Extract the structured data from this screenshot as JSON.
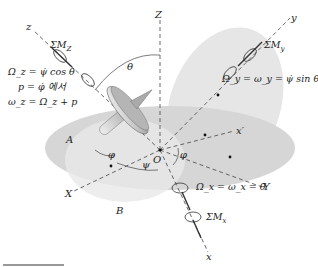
{
  "diagram": {
    "axes": {
      "fixed": [
        "X",
        "Y",
        "Z"
      ],
      "moving": [
        "x",
        "y",
        "z"
      ],
      "auxiliary": "x'",
      "origin": "O"
    },
    "angles": [
      "θ",
      "φ",
      "ψ",
      "φ"
    ],
    "points": [
      "A",
      "B"
    ],
    "moments": {
      "z": "ΣM_z",
      "y": "ΣM_y",
      "x": "ΣM_x"
    },
    "equations": {
      "z_line1": "Ω_z = ψ̇ cos θ",
      "z_line2": "p = φ̇ 에서",
      "z_line3": "ω_z = Ω_z + p",
      "y": "Ω_y = ω_y = ψ̇ sin θ",
      "x": "Ω_x = ω_x = θ̇"
    }
  },
  "labels": {
    "z": "z",
    "Z": "Z",
    "y": "y",
    "Y": "Y",
    "X": "X",
    "x": "x",
    "xp": "x′",
    "O": "O",
    "A": "A",
    "B": "B",
    "theta": "θ",
    "phi1": "φ",
    "phi2": "φ",
    "psi": "ψ",
    "sumMz": "ΣM",
    "sumMz_sub": "Z",
    "sumMy": "ΣM",
    "sumMy_sub": "y",
    "sumMx": "ΣM",
    "sumMx_sub": "x",
    "eq_z1": "Ω_z = ψ̇ cos θ",
    "eq_z2": "p = φ̇ 에서",
    "eq_z3": "ω_z = Ω_z + p",
    "eq_y": "Ω_y = ω_y = ψ̇ sin θ",
    "eq_x": "Ω_x = ω_x = θ̇"
  }
}
